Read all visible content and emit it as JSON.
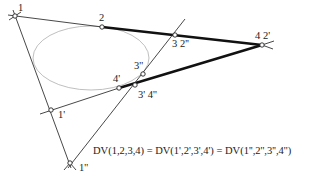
{
  "diagram": {
    "formula": "DV(1,2,3,4) = DV(1',2',3',4') = DV(1'',2'',3'',4'')",
    "colors": {
      "background": "#ffffff",
      "line": "#333333",
      "thick_line": "#111111",
      "ellipse": "#b8b8b8",
      "text": "#222222"
    },
    "points": {
      "p1": {
        "label": "1",
        "x": 15,
        "y": 16
      },
      "p2": {
        "label": "2",
        "x": 102,
        "y": 27
      },
      "p3": {
        "label": "3 2''",
        "x": 175,
        "y": 35
      },
      "p4": {
        "label": "4 2'",
        "x": 262,
        "y": 45
      },
      "p1p": {
        "label": "1'",
        "x": 51,
        "y": 110
      },
      "p3pp": {
        "label": "3''",
        "x": 143,
        "y": 74
      },
      "p4p": {
        "label": "4'",
        "x": 119,
        "y": 88
      },
      "p3p": {
        "label": "3'  4''",
        "x": 135,
        "y": 85
      },
      "p1pp": {
        "label": "1''",
        "x": 70,
        "y": 163
      }
    },
    "ellipse": {
      "cx": 91,
      "cy": 58,
      "rx": 58,
      "ry": 32
    }
  }
}
